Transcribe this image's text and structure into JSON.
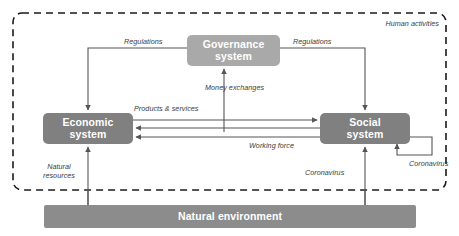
{
  "diagram": {
    "boundary": {
      "label": "Human activities",
      "style": "dashed-rounded-rectangle"
    },
    "nodes": [
      {
        "id": "governance",
        "label_line1": "Governance",
        "label_line2": "system",
        "color": "#a9a9a9",
        "shape": "rounded-rectangle"
      },
      {
        "id": "economic",
        "label_line1": "Economic",
        "label_line2": "system",
        "color": "#808080",
        "shape": "rounded-rectangle"
      },
      {
        "id": "social",
        "label_line1": "Social",
        "label_line2": "system",
        "color": "#808080",
        "shape": "rounded-rectangle"
      },
      {
        "id": "natural_environment",
        "label": "Natural environment",
        "color": "#8c8c8c",
        "shape": "rectangle"
      }
    ],
    "edges": [
      {
        "id": "regulations_to_economic",
        "label": "Regulations",
        "from": "governance",
        "to": "economic",
        "direction": "down"
      },
      {
        "id": "regulations_to_social",
        "label": "Regulations",
        "from": "governance",
        "to": "social",
        "direction": "down"
      },
      {
        "id": "money_exchanges",
        "label": "Money exchanges",
        "from": "economic_social",
        "to": "governance",
        "direction": "up"
      },
      {
        "id": "products_services",
        "label": "Products & services",
        "from": "economic",
        "to": "social",
        "direction": "right"
      },
      {
        "id": "working_force",
        "label": "Working force",
        "from": "social",
        "to": "economic",
        "direction": "left"
      },
      {
        "id": "natural_resources",
        "label": "Natural resources",
        "from": "natural_environment",
        "to": "economic",
        "direction": "up"
      },
      {
        "id": "coronavirus_from_nature",
        "label": "Coronavirus",
        "from": "natural_environment",
        "to": "social",
        "direction": "up"
      },
      {
        "id": "coronavirus_self_loop",
        "label": "Coronavirus",
        "from": "social",
        "to": "social",
        "direction": "self-loop"
      }
    ]
  },
  "colors": {
    "node_dark": "#808080",
    "node_mid": "#8c8c8c",
    "node_light": "#a9a9a9",
    "line": "#555555",
    "boundary": "#1a1a1a",
    "text_on_node": "#ffffff",
    "label_text": "#3b3b3b",
    "background": "#ffffff"
  }
}
